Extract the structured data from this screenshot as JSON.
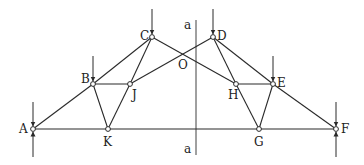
{
  "diagram": {
    "type": "truss",
    "stroke_color": "#2a2a2a",
    "background": "#ffffff",
    "nodes": {
      "A": {
        "label": "A",
        "x": 33,
        "y": 129
      },
      "B": {
        "label": "B",
        "x": 93,
        "y": 84
      },
      "C": {
        "label": "C",
        "x": 152,
        "y": 37
      },
      "D": {
        "label": "D",
        "x": 213,
        "y": 37
      },
      "E": {
        "label": "E",
        "x": 273,
        "y": 84
      },
      "F": {
        "label": "F",
        "x": 336,
        "y": 129
      },
      "G": {
        "label": "G",
        "x": 259,
        "y": 129
      },
      "H": {
        "label": "H",
        "x": 236,
        "y": 84
      },
      "J": {
        "label": "J",
        "x": 130,
        "y": 84
      },
      "K": {
        "label": "K",
        "x": 108,
        "y": 129
      },
      "O": {
        "label": "O"
      }
    },
    "members": [
      [
        "A",
        "B"
      ],
      [
        "B",
        "C"
      ],
      [
        "A",
        "F"
      ],
      [
        "D",
        "E"
      ],
      [
        "E",
        "F"
      ],
      [
        "B",
        "J"
      ],
      [
        "B",
        "K"
      ],
      [
        "J",
        "K"
      ],
      [
        "C",
        "J"
      ],
      [
        "C",
        "H"
      ],
      [
        "H",
        "E"
      ],
      [
        "H",
        "G"
      ],
      [
        "E",
        "G"
      ],
      [
        "D",
        "H"
      ],
      [
        "D",
        "J"
      ]
    ],
    "section_line": {
      "label_top": "a",
      "label_bottom": "a",
      "x": 196,
      "y1": 20,
      "y2": 155
    },
    "loads": [
      "B",
      "C",
      "D",
      "E"
    ],
    "supports": [
      "A",
      "F"
    ]
  }
}
